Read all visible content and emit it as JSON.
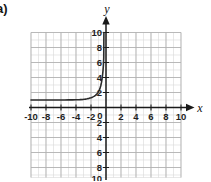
{
  "figure": {
    "part_label": "a)",
    "x_axis_name": "x",
    "y_axis_name": "y",
    "x_tick_labels": [
      "-10",
      "-8",
      "-6",
      "-4",
      "-2",
      "2",
      "4",
      "6",
      "8",
      "10"
    ],
    "y_tick_labels_positive": [
      "10",
      "8",
      "6",
      "4",
      "2"
    ],
    "y_tick_labels_negative": [
      "2",
      "4",
      "6",
      "8",
      "10"
    ],
    "origin_label": "0"
  },
  "chart_data": {
    "type": "line",
    "title": "",
    "xlabel": "x",
    "ylabel": "y",
    "xlim": [
      -10,
      10
    ],
    "ylim": [
      -10,
      10
    ],
    "xticks": [
      -10,
      -8,
      -6,
      -4,
      -2,
      0,
      2,
      4,
      6,
      8,
      10
    ],
    "yticks": [
      -10,
      -8,
      -6,
      -4,
      -2,
      0,
      2,
      4,
      6,
      8,
      10
    ],
    "grid": true,
    "minor_grid_step": 1,
    "major_grid_step": 2,
    "legend": "none",
    "series": [
      {
        "name": "exponential curve",
        "description": "Increasing exponential with horizontal asymptote y = 1, rising sharply just left of x = 0",
        "asymptote_y": 1,
        "x": [
          -10.0,
          -9.5,
          -9.0,
          -8.5,
          -8.0,
          -7.5,
          -7.0,
          -6.5,
          -6.0,
          -5.5,
          -5.0,
          -4.5,
          -4.0,
          -3.5,
          -3.0,
          -2.75,
          -2.5,
          -2.25,
          -2.0,
          -1.8,
          -1.6,
          -1.4,
          -1.2,
          -1.1,
          -1.0,
          -0.9,
          -0.8,
          -0.7,
          -0.6,
          -0.5,
          -0.45,
          -0.4,
          -0.35,
          -0.3,
          -0.28
        ],
        "y": [
          1.0,
          1.0,
          1.0,
          1.0,
          1.0,
          1.0,
          1.0,
          1.0,
          1.0,
          1.0,
          1.01,
          1.02,
          1.03,
          1.05,
          1.09,
          1.12,
          1.16,
          1.22,
          1.3,
          1.38,
          1.48,
          1.62,
          1.82,
          1.95,
          2.1,
          2.3,
          2.55,
          2.9,
          3.35,
          4.0,
          4.4,
          4.9,
          5.6,
          6.6,
          10.0
        ]
      }
    ]
  }
}
